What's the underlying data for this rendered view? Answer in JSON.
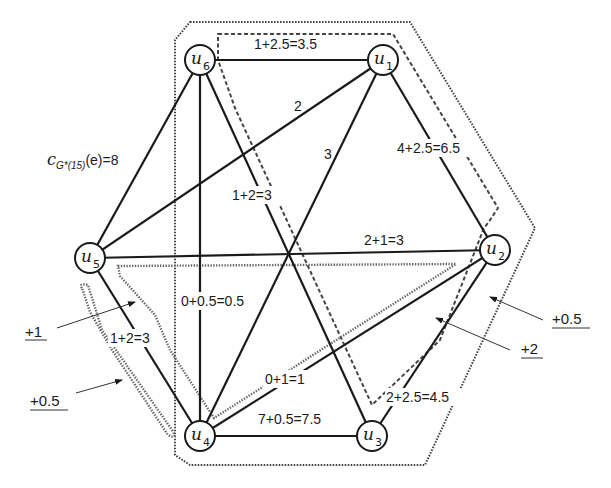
{
  "diagram": {
    "type": "graph",
    "formula_label": {
      "prefix": "c",
      "subscript": "G*(15)",
      "suffix": "(e)=8"
    },
    "nodes": [
      {
        "id": "u1",
        "base": "u",
        "index": "1",
        "x": 383,
        "y": 60
      },
      {
        "id": "u2",
        "base": "u",
        "index": "2",
        "x": 495,
        "y": 250
      },
      {
        "id": "u3",
        "base": "u",
        "index": "3",
        "x": 372,
        "y": 436
      },
      {
        "id": "u4",
        "base": "u",
        "index": "4",
        "x": 200,
        "y": 436
      },
      {
        "id": "u5",
        "base": "u",
        "index": "5",
        "x": 90,
        "y": 258
      },
      {
        "id": "u6",
        "base": "u",
        "index": "6",
        "x": 200,
        "y": 60
      }
    ],
    "edges": [
      {
        "from": "u6",
        "to": "u1",
        "label": "1+2.5=3.5"
      },
      {
        "from": "u1",
        "to": "u2",
        "label": "4+2.5=6.5"
      },
      {
        "from": "u2",
        "to": "u3",
        "label": "2+2.5=4.5"
      },
      {
        "from": "u3",
        "to": "u4",
        "label": "7+0.5=7.5"
      },
      {
        "from": "u4",
        "to": "u5",
        "label": "1+2=3"
      },
      {
        "from": "u5",
        "to": "u6",
        "label": "c_G*(15)(e)=8"
      },
      {
        "from": "u5",
        "to": "u1",
        "label": "2"
      },
      {
        "from": "u1",
        "to": "u4",
        "label": "3"
      },
      {
        "from": "u6",
        "to": "u3",
        "label": "1+2=3"
      },
      {
        "from": "u5",
        "to": "u2",
        "label": "2+1=3"
      },
      {
        "from": "u6",
        "to": "u4",
        "label": "0+0.5=0.5"
      },
      {
        "from": "u4",
        "to": "u2",
        "label": "0+1=1"
      }
    ],
    "edge_labels": {
      "u6_u1": "1+2.5=3.5",
      "u1_u2": "4+2.5=6.5",
      "u2_u3": "2+2.5=4.5",
      "u3_u4": "7+0.5=7.5",
      "u4_u5": "1+2=3",
      "u5_u1": "2",
      "u1_u4": "3",
      "u6_u3": "1+2=3",
      "u5_u2": "2+1=3",
      "u6_u4": "0+0.5=0.5",
      "u4_u2": "0+1=1"
    },
    "annotations": [
      {
        "id": "plus1-left",
        "text": "+1"
      },
      {
        "id": "plus05-left",
        "text": "+0.5"
      },
      {
        "id": "plus05-right",
        "text": "+0.5"
      },
      {
        "id": "plus2-right",
        "text": "+2"
      }
    ],
    "colors": {
      "ink": "#1a1a1a",
      "dotted": "#444444",
      "gray_cut": "#666666",
      "background": "#ffffff"
    }
  }
}
